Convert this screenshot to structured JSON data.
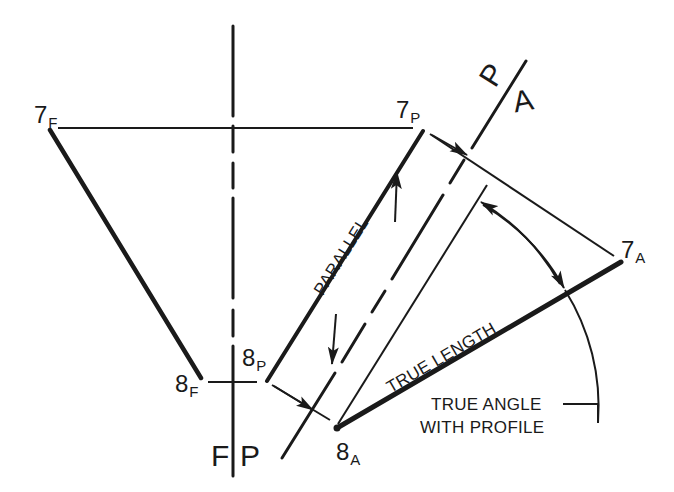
{
  "diagram": {
    "type": "descriptive-geometry-auxiliary-view",
    "colors": {
      "ink": "#1a1a1a",
      "background": "#ffffff"
    },
    "points": {
      "p7F": {
        "main": "7",
        "sub": "F"
      },
      "p8F": {
        "main": "8",
        "sub": "F"
      },
      "p7P": {
        "main": "7",
        "sub": "P"
      },
      "p8P": {
        "main": "8",
        "sub": "P"
      },
      "p7A": {
        "main": "7",
        "sub": "A"
      },
      "p8A": {
        "main": "8",
        "sub": "A"
      }
    },
    "fold_lines": {
      "fp": {
        "left": "F",
        "right": "P"
      },
      "pa": {
        "left": "P",
        "right": "A"
      }
    },
    "annotations": {
      "parallel": "PARALLEL",
      "true_length": "TRUE LENGTH",
      "true_angle_line1": "TRUE ANGLE",
      "true_angle_line2": "WITH PROFILE"
    }
  }
}
